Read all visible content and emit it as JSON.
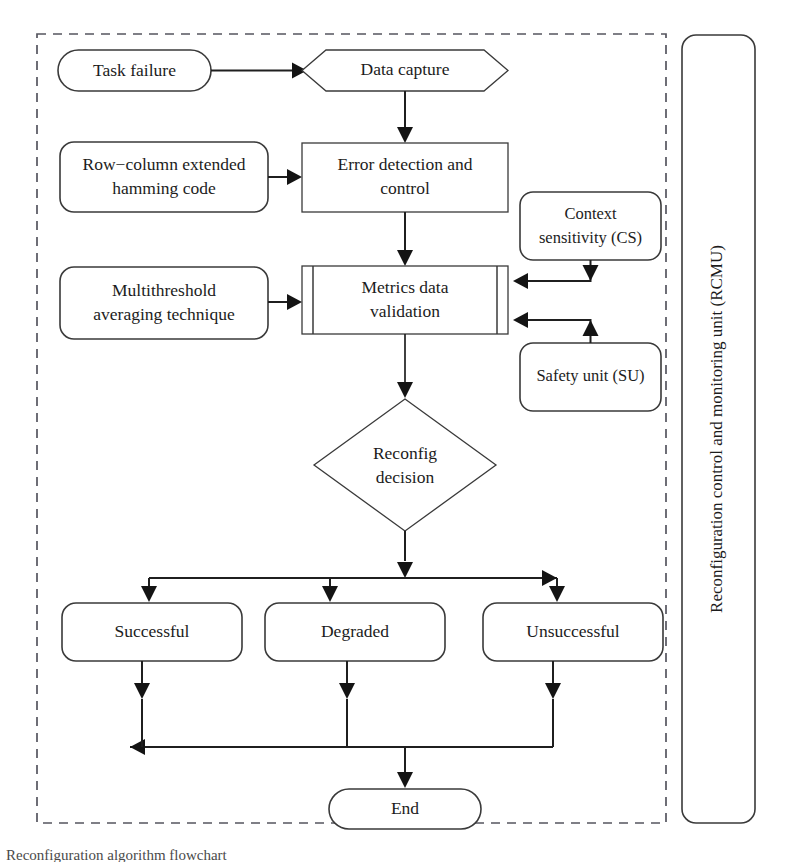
{
  "diagram": {
    "title": "Reconfiguration algorithm flowchart",
    "group_label": "Reconfiguration control and monitoring unit (RCMU)",
    "colors": {
      "stroke": "#3a3a3a",
      "arrow": "#141414",
      "dashed_border": "#55555f",
      "background": "#ffffff",
      "text": "#1c1c1c"
    },
    "nodes": {
      "task_failure": {
        "label": "Task failure",
        "shape": "stadium"
      },
      "data_capture": {
        "label": "Data capture",
        "shape": "hexagon"
      },
      "hamming_code": {
        "label_line1": "Row−column extended",
        "label_line2": "hamming code",
        "shape": "rounded-rect"
      },
      "error_detection": {
        "label_line1": "Error detection and",
        "label_line2": "control",
        "shape": "rect"
      },
      "multithreshold": {
        "label_line1": "Multithreshold",
        "label_line2": "averaging technique",
        "shape": "rounded-rect"
      },
      "metrics_validation": {
        "label_line1": "Metrics data",
        "label_line2": "validation",
        "shape": "predefined-process"
      },
      "context_sensitivity": {
        "label_line1": "Context",
        "label_line2": "sensitivity (CS)",
        "shape": "rounded-rect"
      },
      "safety_unit": {
        "label": "Safety unit (SU)",
        "shape": "rounded-rect"
      },
      "reconfig_decision": {
        "label_line1": "Reconfig",
        "label_line2": "decision",
        "shape": "diamond"
      },
      "successful": {
        "label": "Successful",
        "shape": "rounded-rect"
      },
      "degraded": {
        "label": "Degraded",
        "shape": "rounded-rect"
      },
      "unsuccessful": {
        "label": "Unsuccessful",
        "shape": "rounded-rect"
      },
      "end": {
        "label": "End",
        "shape": "stadium"
      }
    },
    "edges": [
      {
        "from": "task_failure",
        "to": "data_capture",
        "direction": "right"
      },
      {
        "from": "data_capture",
        "to": "error_detection",
        "direction": "down"
      },
      {
        "from": "hamming_code",
        "to": "error_detection",
        "direction": "right"
      },
      {
        "from": "error_detection",
        "to": "metrics_validation",
        "direction": "down"
      },
      {
        "from": "multithreshold",
        "to": "metrics_validation",
        "direction": "right"
      },
      {
        "from": "context_sensitivity",
        "to": "metrics_validation",
        "direction": "left"
      },
      {
        "from": "safety_unit",
        "to": "metrics_validation",
        "direction": "left"
      },
      {
        "from": "metrics_validation",
        "to": "reconfig_decision",
        "direction": "down"
      },
      {
        "from": "reconfig_decision",
        "to": "successful",
        "direction": "down"
      },
      {
        "from": "reconfig_decision",
        "to": "degraded",
        "direction": "down"
      },
      {
        "from": "reconfig_decision",
        "to": "unsuccessful",
        "direction": "down"
      },
      {
        "from": "successful",
        "to": "end",
        "direction": "down"
      },
      {
        "from": "degraded",
        "to": "end",
        "direction": "down"
      },
      {
        "from": "unsuccessful",
        "to": "end",
        "direction": "down"
      }
    ]
  }
}
